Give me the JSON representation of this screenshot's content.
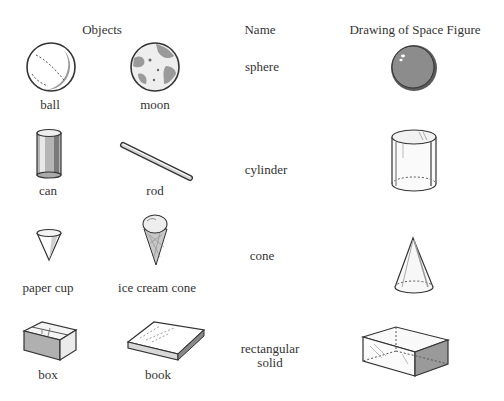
{
  "headers": {
    "objects": "Objects",
    "name": "Name",
    "drawing": "Drawing of Space Figure"
  },
  "rows": [
    {
      "objects": [
        {
          "label": "ball",
          "icon": "baseball-icon"
        },
        {
          "label": "moon",
          "icon": "moon-icon"
        }
      ],
      "name": "sphere",
      "figure": "sphere-drawing"
    },
    {
      "objects": [
        {
          "label": "can",
          "icon": "can-icon"
        },
        {
          "label": "rod",
          "icon": "rod-icon"
        }
      ],
      "name": "cylinder",
      "figure": "cylinder-drawing"
    },
    {
      "objects": [
        {
          "label": "paper cup",
          "icon": "paper-cup-icon"
        },
        {
          "label": "ice cream cone",
          "icon": "ice-cream-cone-icon"
        }
      ],
      "name": "cone",
      "figure": "cone-drawing"
    },
    {
      "objects": [
        {
          "label": "box",
          "icon": "box-icon"
        },
        {
          "label": "book",
          "icon": "book-icon"
        }
      ],
      "name_line1": "rectangular",
      "name_line2": "solid",
      "name": "rectangular solid",
      "figure": "rectangular-solid-drawing"
    }
  ],
  "colors": {
    "ink": "#333333",
    "shade": "#9a9a9a",
    "dark": "#777777"
  }
}
